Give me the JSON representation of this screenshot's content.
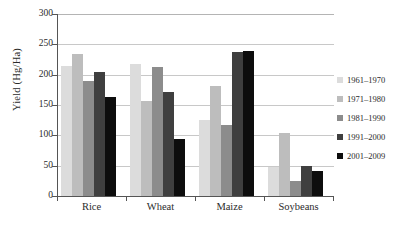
{
  "chart_data": {
    "type": "bar",
    "title": "",
    "subtitle": "",
    "xlabel": "",
    "ylabel": "Yield (Hg/Ha)",
    "ylim": [
      0,
      300
    ],
    "yticks": [
      0,
      50,
      100,
      150,
      200,
      250,
      300
    ],
    "ytick_labels": [
      "0",
      "50",
      "100",
      "150",
      "200",
      "250",
      "300"
    ],
    "grid": true,
    "legend_position": "right",
    "categories": [
      "Rice",
      "Wheat",
      "Maize",
      "Soybeans"
    ],
    "series": [
      {
        "name": "1961–1970",
        "color": "#dcdcdc",
        "values": [
          214,
          217,
          125,
          48
        ]
      },
      {
        "name": "1971–1980",
        "color": "#bdbdbd",
        "values": [
          234,
          156,
          181,
          104
        ]
      },
      {
        "name": "1981–1990",
        "color": "#8c8c8c",
        "values": [
          190,
          213,
          117,
          25
        ]
      },
      {
        "name": "1991–2000",
        "color": "#3f3f3f",
        "values": [
          205,
          172,
          237,
          50
        ]
      },
      {
        "name": "2001–2009",
        "color": "#0d0d0d",
        "values": [
          163,
          94,
          239,
          42
        ]
      }
    ]
  },
  "axes": {
    "y_title": "Yield (Hg/Ha)"
  },
  "legend": {
    "items": [
      {
        "label": "1961–1970",
        "color": "#dcdcdc"
      },
      {
        "label": "1971–1980",
        "color": "#bdbdbd"
      },
      {
        "label": "1981–1990",
        "color": "#8c8c8c"
      },
      {
        "label": "1991–2000",
        "color": "#3f3f3f"
      },
      {
        "label": "2001–2009",
        "color": "#0d0d0d"
      }
    ]
  }
}
